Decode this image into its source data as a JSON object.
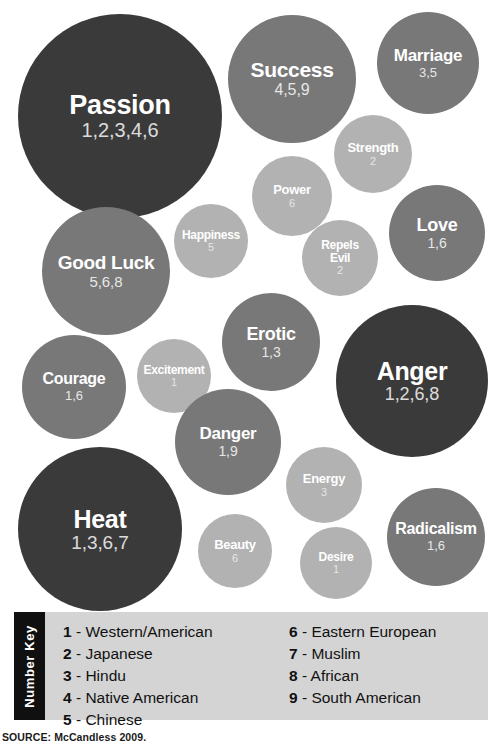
{
  "chart_data": {
    "type": "bubble",
    "value_key": "numbers refer to cultures listed in the Number Key",
    "tone_legend": {
      "dark": "#3a3a3a",
      "mid": "#787878",
      "light": "#b2b2b2"
    },
    "bubbles": [
      {
        "id": "passion",
        "label": "Passion",
        "numbers": "1,2,3,4,6",
        "cultures": [
          1,
          2,
          3,
          4,
          6
        ],
        "count": 5,
        "tone": "dark",
        "diameter": 204,
        "x": 18,
        "y": 14,
        "label_size": 27,
        "num_size": 20
      },
      {
        "id": "success",
        "label": "Success",
        "numbers": "4,5,9",
        "cultures": [
          4,
          5,
          9
        ],
        "count": 3,
        "tone": "mid",
        "diameter": 128,
        "x": 228,
        "y": 15,
        "label_size": 21,
        "num_size": 16
      },
      {
        "id": "marriage",
        "label": "Marriage",
        "numbers": "3,5",
        "cultures": [
          3,
          5
        ],
        "count": 2,
        "tone": "mid",
        "diameter": 102,
        "x": 377,
        "y": 12,
        "label_size": 17,
        "num_size": 13
      },
      {
        "id": "strength",
        "label": "Strength",
        "numbers": "2",
        "cultures": [
          2
        ],
        "count": 1,
        "tone": "light",
        "diameter": 78,
        "x": 334,
        "y": 115,
        "label_size": 13,
        "num_size": 11
      },
      {
        "id": "power",
        "label": "Power",
        "numbers": "6",
        "cultures": [
          6
        ],
        "count": 1,
        "tone": "light",
        "diameter": 80,
        "x": 252,
        "y": 156,
        "label_size": 13,
        "num_size": 11
      },
      {
        "id": "happiness",
        "label": "Happiness",
        "numbers": "5",
        "cultures": [
          5
        ],
        "count": 1,
        "tone": "light",
        "diameter": 74,
        "x": 174,
        "y": 204,
        "label_size": 12,
        "num_size": 11
      },
      {
        "id": "repels-evil",
        "label": "Repels\nEvil",
        "numbers": "2",
        "cultures": [
          2
        ],
        "count": 1,
        "tone": "light",
        "diameter": 76,
        "x": 302,
        "y": 220,
        "label_size": 12,
        "num_size": 11
      },
      {
        "id": "love",
        "label": "Love",
        "numbers": "1,6",
        "cultures": [
          1,
          6
        ],
        "count": 2,
        "tone": "mid",
        "diameter": 96,
        "x": 389,
        "y": 185,
        "label_size": 18,
        "num_size": 14
      },
      {
        "id": "good-luck",
        "label": "Good Luck",
        "numbers": "5,6,8",
        "cultures": [
          5,
          6,
          8
        ],
        "count": 3,
        "tone": "mid",
        "diameter": 128,
        "x": 42,
        "y": 207,
        "label_size": 19,
        "num_size": 15
      },
      {
        "id": "erotic",
        "label": "Erotic",
        "numbers": "1,3",
        "cultures": [
          1,
          3
        ],
        "count": 2,
        "tone": "mid",
        "diameter": 98,
        "x": 222,
        "y": 293,
        "label_size": 18,
        "num_size": 14
      },
      {
        "id": "excitement",
        "label": "Excitement",
        "numbers": "1",
        "cultures": [
          1
        ],
        "count": 1,
        "tone": "light",
        "diameter": 74,
        "x": 137,
        "y": 339,
        "label_size": 12,
        "num_size": 11
      },
      {
        "id": "courage",
        "label": "Courage",
        "numbers": "1,6",
        "cultures": [
          1,
          6
        ],
        "count": 2,
        "tone": "mid",
        "diameter": 104,
        "x": 22,
        "y": 335,
        "label_size": 16,
        "num_size": 13
      },
      {
        "id": "anger",
        "label": "Anger",
        "numbers": "1,2,6,8",
        "cultures": [
          1,
          2,
          6,
          8
        ],
        "count": 4,
        "tone": "dark",
        "diameter": 152,
        "x": 336,
        "y": 305,
        "label_size": 25,
        "num_size": 18
      },
      {
        "id": "danger",
        "label": "Danger",
        "numbers": "1,9",
        "cultures": [
          1,
          9
        ],
        "count": 2,
        "tone": "mid",
        "diameter": 106,
        "x": 175,
        "y": 389,
        "label_size": 17,
        "num_size": 14
      },
      {
        "id": "energy",
        "label": "Energy",
        "numbers": "3",
        "cultures": [
          3
        ],
        "count": 1,
        "tone": "light",
        "diameter": 76,
        "x": 286,
        "y": 447,
        "label_size": 13,
        "num_size": 11
      },
      {
        "id": "heat",
        "label": "Heat",
        "numbers": "1,3,6,7",
        "cultures": [
          1,
          3,
          6,
          7
        ],
        "count": 4,
        "tone": "dark",
        "diameter": 164,
        "x": 18,
        "y": 447,
        "label_size": 25,
        "num_size": 19
      },
      {
        "id": "radicalism",
        "label": "Radicalism",
        "numbers": "1,6",
        "cultures": [
          1,
          6
        ],
        "count": 2,
        "tone": "mid",
        "diameter": 98,
        "x": 387,
        "y": 488,
        "label_size": 16,
        "num_size": 13
      },
      {
        "id": "beauty",
        "label": "Beauty",
        "numbers": "6",
        "cultures": [
          6
        ],
        "count": 1,
        "tone": "light",
        "diameter": 74,
        "x": 198,
        "y": 514,
        "label_size": 13,
        "num_size": 11
      },
      {
        "id": "desire",
        "label": "Desire",
        "numbers": "1",
        "cultures": [
          1
        ],
        "count": 1,
        "tone": "light",
        "diameter": 72,
        "x": 300,
        "y": 527,
        "label_size": 12,
        "num_size": 11
      }
    ]
  },
  "legend": {
    "tab_label": "Number Key",
    "dash": "-",
    "left_column": [
      {
        "num": "1",
        "text": "Western/American"
      },
      {
        "num": "2",
        "text": "Japanese"
      },
      {
        "num": "3",
        "text": "Hindu"
      },
      {
        "num": "4",
        "text": "Native American"
      },
      {
        "num": "5",
        "text": "Chinese"
      }
    ],
    "right_column": [
      {
        "num": "6",
        "text": "Eastern European"
      },
      {
        "num": "7",
        "text": "Muslim"
      },
      {
        "num": "8",
        "text": "African"
      },
      {
        "num": "9",
        "text": "South American"
      }
    ]
  },
  "source": {
    "text": "SOURCE: McCandless 2009."
  }
}
